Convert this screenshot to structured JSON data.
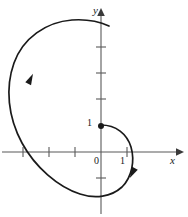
{
  "figure": {
    "kind": "math-plot",
    "background_color": "#ffffff",
    "stroke_color": "#1a1a1a",
    "axis_color": "#595959"
  },
  "axes": {
    "x_axis_label": "x",
    "y_axis_label": "y",
    "origin_label": "0",
    "x_tick_label": "1",
    "y_tick_label": "1",
    "origin_px": {
      "x": 101,
      "y": 152
    },
    "unit_px": 26,
    "x_range": [
      -3.9,
      3.0
    ],
    "y_range": [
      -1.75,
      5.3
    ],
    "x_ticks": [
      -3,
      -2,
      -1,
      1,
      2
    ],
    "y_ticks": [
      -1,
      1,
      2,
      3,
      4
    ],
    "x_tick_labeled": [
      1
    ],
    "y_tick_labeled": [
      1
    ],
    "grid": false,
    "arrow_x": true,
    "arrow_y": true
  },
  "points": [
    {
      "name": "start-point",
      "label": "1",
      "x": 0,
      "y": 1,
      "marker": "filled-circle",
      "radius_px": 3
    }
  ],
  "chart_data": {
    "type": "line",
    "title": "",
    "xlabel": "x",
    "ylabel": "y",
    "xlim": [
      -3.9,
      3.0
    ],
    "ylim": [
      -1.75,
      5.3
    ],
    "grid": false,
    "series": [
      {
        "name": "spiral",
        "description": "outward spiral curve starting at (0,1), traversed clockwise then sweeping outward counterclockwise",
        "closed": false,
        "direction_arrows": [
          {
            "at_px": {
              "x": 133,
              "y": 172
            },
            "angle_deg": 118
          },
          {
            "at_px": {
              "x": 30,
              "y": 80
            },
            "angle_deg": -64
          }
        ],
        "path_px": "M 101 125 C 116 125 127 134 131 147 C 135 161 132 177 122 187 C 111 197 95 199 80 194 C 58 187 35 167 22 143 C 8 117 5 88 14 63 C 23 38 46 22 72 20 C 86 19 98 21 109 26"
      }
    ]
  }
}
